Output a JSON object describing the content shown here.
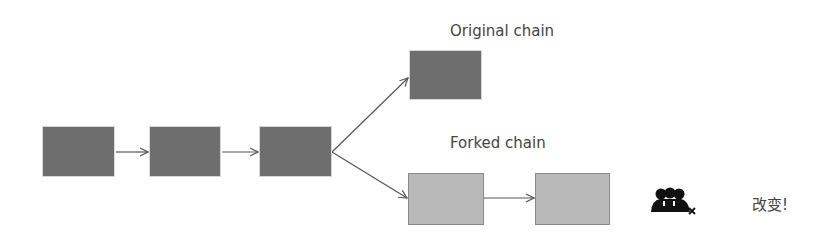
{
  "diagram": {
    "labels": {
      "original": "Original chain",
      "forked": "Forked chain",
      "change": "改变!"
    },
    "colors": {
      "main_block": "#6e6e6e",
      "fork_block": "#b9b9b9",
      "arrow": "#555555"
    },
    "blocks": [
      {
        "id": "block-1",
        "type": "main"
      },
      {
        "id": "block-2",
        "type": "main"
      },
      {
        "id": "block-3",
        "type": "main"
      },
      {
        "id": "original-block",
        "type": "main"
      },
      {
        "id": "fork-block-1",
        "type": "fork"
      },
      {
        "id": "fork-block-2",
        "type": "fork"
      }
    ],
    "icon": "group-of-people-with-x-icon"
  }
}
